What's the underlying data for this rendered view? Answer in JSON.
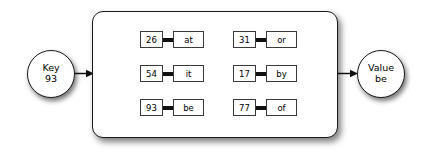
{
  "diagram": {
    "key_node": {
      "label": "Key",
      "value": "93",
      "icon": "circle-node-icon"
    },
    "value_node": {
      "label": "Value",
      "value": "be",
      "icon": "circle-node-icon"
    },
    "arrows": {
      "in": "arrow-right-icon",
      "out": "arrow-right-icon"
    },
    "table": {
      "columns": [
        {
          "name": "left-column",
          "entries": [
            {
              "key": "26",
              "value": "at"
            },
            {
              "key": "54",
              "value": "it"
            },
            {
              "key": "93",
              "value": "be"
            }
          ]
        },
        {
          "name": "right-column",
          "entries": [
            {
              "key": "31",
              "value": "or"
            },
            {
              "key": "17",
              "value": "by"
            },
            {
              "key": "77",
              "value": "of"
            }
          ]
        }
      ]
    },
    "colors": {
      "stroke": "#1a1a1a",
      "fill": "#ffffff",
      "link": "#111111",
      "background": "#ffffff"
    }
  }
}
